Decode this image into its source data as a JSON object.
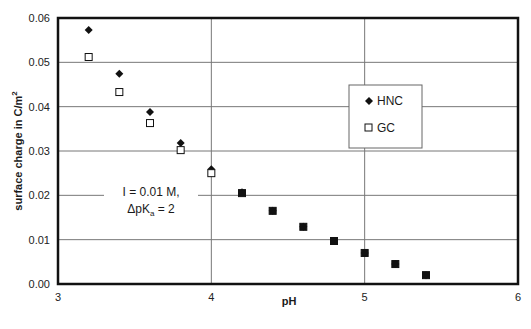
{
  "chart_data": {
    "type": "scatter",
    "title": "",
    "xlabel": "pH",
    "ylabel": "surface charge in C/m",
    "ylabel_superscript": "2",
    "xlim": [
      3,
      6
    ],
    "ylim": [
      0,
      0.06
    ],
    "x_ticks": [
      "3",
      "4",
      "5",
      "6"
    ],
    "y_ticks": [
      "0.00",
      "0.01",
      "0.02",
      "0.03",
      "0.04",
      "0.05",
      "0.06"
    ],
    "grid": true,
    "legend_position": "inside-right",
    "series": [
      {
        "name": "HNC",
        "marker": "filled-diamond",
        "x": [
          3.2,
          3.4,
          3.6,
          3.8,
          4.0,
          4.2,
          4.4,
          4.6,
          4.8,
          5.0,
          5.2,
          5.4
        ],
        "values": [
          0.0573,
          0.0474,
          0.0388,
          0.0318,
          0.0259,
          0.0207,
          0.0165,
          0.0129,
          0.0097,
          0.007,
          0.0045,
          0.002
        ]
      },
      {
        "name": "GC",
        "marker": "open-square",
        "x": [
          3.2,
          3.4,
          3.6,
          3.8,
          4.0,
          4.2,
          4.4,
          4.6,
          4.8,
          5.0,
          5.2,
          5.4
        ],
        "values": [
          0.0512,
          0.0433,
          0.0363,
          0.0302,
          0.025,
          0.0205,
          0.0165,
          0.0129,
          0.0097,
          0.007,
          0.0045,
          0.002
        ]
      }
    ],
    "annotations": [
      {
        "line1": "I = 0.01 M,",
        "line2_prefix": "ΔpK",
        "line2_sub": "a",
        "line2_suffix": " = 2"
      }
    ]
  },
  "legend": {
    "items": [
      {
        "label": "HNC"
      },
      {
        "label": "GC"
      }
    ]
  }
}
